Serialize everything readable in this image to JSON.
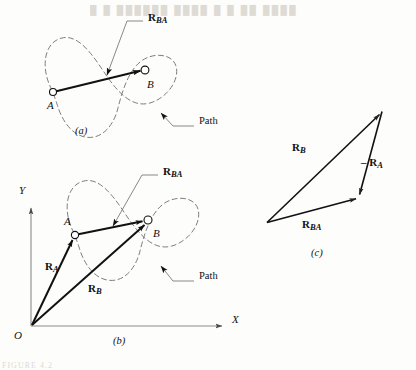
{
  "figure": {
    "kind": "vector-diagram",
    "background_color": "#fdfdfc",
    "ink_color": "#111111",
    "dashed_path_color": "#6e6e6e",
    "axis_color": "#8a8a8a",
    "leader_color": "#555555"
  },
  "panels": [
    {
      "id": "a",
      "label": "(a)"
    },
    {
      "id": "b",
      "label": "(b)"
    },
    {
      "id": "c",
      "label": "(c)"
    }
  ],
  "panel_a": {
    "label": "(a)",
    "points": [
      {
        "name": "A",
        "label": "A",
        "x": 53,
        "y": 92,
        "label_x": 47,
        "label_y": 106
      },
      {
        "name": "B",
        "label": "B",
        "x": 145,
        "y": 70,
        "label_x": 147,
        "label_y": 85
      }
    ],
    "vector_label": "R",
    "vector_sub": "BA",
    "vector_label_x": 148,
    "vector_label_y": 18,
    "path_label": "Path",
    "path_label_x": 199,
    "path_label_y": 122
  },
  "panel_b": {
    "label": "(b)",
    "origin_label": "O",
    "axis_x_label": "X",
    "axis_y_label": "Y",
    "points": [
      {
        "name": "A",
        "label": "A",
        "x": 75,
        "y": 235,
        "label_x": 66,
        "label_y": 222
      },
      {
        "name": "B",
        "label": "B",
        "x": 148,
        "y": 220,
        "label_x": 153,
        "label_y": 234
      }
    ],
    "vectors": [
      {
        "name": "R_BA",
        "base": "R",
        "sub": "BA",
        "label_x": 163,
        "label_y": 172
      },
      {
        "name": "R_A",
        "base": "R",
        "sub": "A",
        "label_x": 49,
        "label_y": 267
      },
      {
        "name": "R_B",
        "base": "R",
        "sub": "B",
        "label_x": 90,
        "label_y": 288
      }
    ],
    "path_label": "Path",
    "path_label_x": 199,
    "path_label_y": 277
  },
  "panel_c": {
    "label": "(c)",
    "vectors": [
      {
        "name": "R_B",
        "base": "R",
        "sub": "B",
        "prefix": "",
        "label_x": 295,
        "label_y": 148
      },
      {
        "name": "minus_R_A",
        "base": "R",
        "sub": "A",
        "prefix": "– ",
        "label_x": 365,
        "label_y": 163
      },
      {
        "name": "R_BA",
        "base": "R",
        "sub": "BA",
        "prefix": "",
        "label_x": 305,
        "label_y": 225
      }
    ],
    "triangle": {
      "left_vertex": {
        "x": 266,
        "y": 223
      },
      "top_vertex": {
        "x": 382,
        "y": 111
      },
      "right_vertex": {
        "x": 359,
        "y": 198
      }
    },
    "label_x": 312,
    "label_y": 255
  },
  "artifacts": {
    "top_ghost_text": "█ █  ██████  ████  █ █  ██ ████",
    "bottom_ghost_text": "FIGURE 4.2"
  }
}
